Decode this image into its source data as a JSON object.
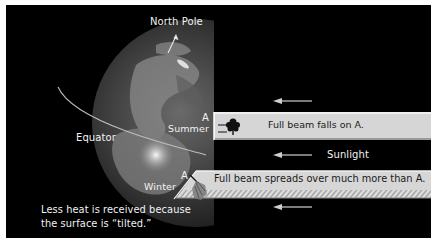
{
  "diagram": {
    "labels": {
      "north_pole": "North Pole",
      "equator": "Equator",
      "summer_point": "A",
      "summer": "Summer",
      "winter_point": "A",
      "winter": "Winter",
      "sunlight": "Sunlight"
    },
    "beams": {
      "summer": "Full beam falls on A.",
      "winter": "Full beam spreads over much more than A."
    },
    "caption": {
      "line1": "Less heat is received because",
      "line2": "the surface is “tilted.”"
    },
    "icons": {
      "tree_summer": "tree-icon",
      "tree_winter": "tilted-tree-icon",
      "arrow": "arrow-left-icon"
    },
    "colors": {
      "background": "#000000",
      "beam": "#d9d9d9",
      "hatch": "#b8b8b8",
      "text": "#f2f2f2",
      "globe": "#3a3a3a"
    }
  }
}
